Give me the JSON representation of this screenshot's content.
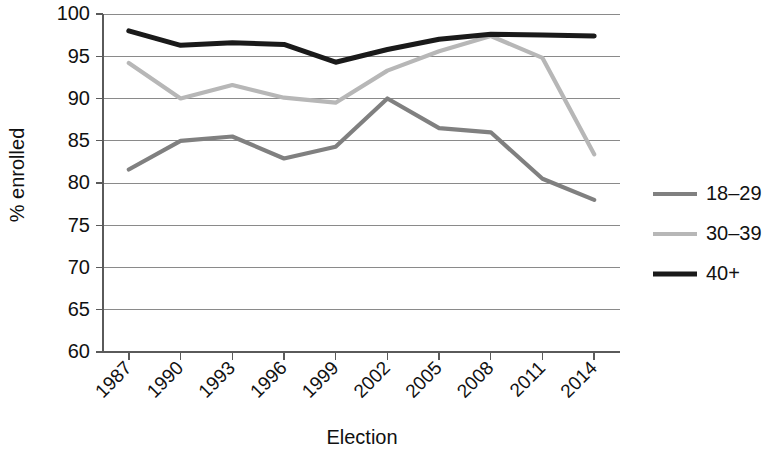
{
  "chart_data": {
    "type": "line",
    "title": "",
    "xlabel": "Election",
    "ylabel": "% enrolled",
    "categories": [
      "1987",
      "1990",
      "1993",
      "1996",
      "1999",
      "2002",
      "2005",
      "2008",
      "2011",
      "2014"
    ],
    "x": [
      1987,
      1990,
      1993,
      1996,
      1999,
      2002,
      2005,
      2008,
      2011,
      2014
    ],
    "ylim": [
      60,
      100
    ],
    "yticks": [
      60,
      65,
      70,
      75,
      80,
      85,
      90,
      95,
      100
    ],
    "grid": true,
    "legend_position": "right",
    "series": [
      {
        "name": "18–29",
        "color": "#808080",
        "values": [
          81.6,
          85.0,
          85.5,
          82.9,
          84.3,
          90.0,
          86.5,
          86.0,
          80.5,
          78.0
        ]
      },
      {
        "name": "30–39",
        "color": "#b7b7b7",
        "values": [
          94.2,
          90.0,
          91.6,
          90.1,
          89.5,
          93.3,
          95.6,
          97.4,
          94.8,
          83.4
        ]
      },
      {
        "name": "40+",
        "color": "#1a1a1a",
        "values": [
          98.0,
          96.3,
          96.6,
          96.4,
          94.3,
          95.8,
          97.0,
          97.6,
          97.5,
          97.4
        ]
      }
    ]
  },
  "axes": {
    "ylabel": "% enrolled",
    "xlabel": "Election",
    "ytick_labels": [
      "100",
      "95",
      "90",
      "85",
      "80",
      "75",
      "70",
      "65",
      "60"
    ],
    "xtick_labels": [
      "1987",
      "1990",
      "1993",
      "1996",
      "1999",
      "2002",
      "2005",
      "2008",
      "2011",
      "2014"
    ]
  },
  "legend": {
    "items": [
      {
        "label": "18–29",
        "color": "#808080"
      },
      {
        "label": "30–39",
        "color": "#b7b7b7"
      },
      {
        "label": "40+",
        "color": "#1a1a1a"
      }
    ]
  }
}
